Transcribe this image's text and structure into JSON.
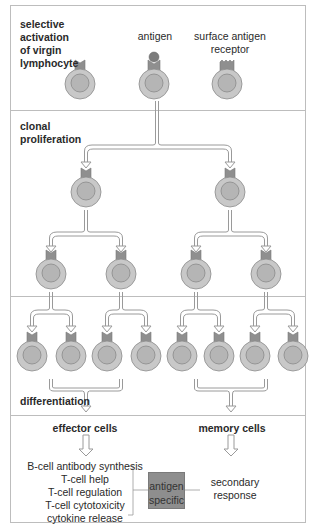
{
  "colors": {
    "cell_outer": "#c8c8c8",
    "cell_inner": "#b5b5b5",
    "cell_stroke": "#8a8a8a",
    "receptor": "#8f8f8f",
    "antigen": "#7c7c7c",
    "frame": "#bdbdbd",
    "arrow_stroke": "#9a9a9a",
    "box_fill": "#8e8e8e"
  },
  "sections": [
    {
      "id": "activation",
      "title": "selective\nactivation\nof virgin\nlymphocyte",
      "lines": [
        "selective",
        "activation",
        "of virgin",
        "lymphocyte"
      ]
    },
    {
      "id": "proliferation",
      "lines": [
        "clonal",
        "proliferation"
      ]
    },
    {
      "id": "differentiation_row",
      "lines": []
    },
    {
      "id": "outcomes",
      "lines": []
    }
  ],
  "labels": {
    "antigen": "antigen",
    "receptor_line1": "surface antigen",
    "receptor_line2": "receptor",
    "differentiation": "differentiation",
    "effector_cells": "effector cells",
    "memory_cells": "memory cells",
    "antigen_specific_line1": "antigen",
    "antigen_specific_line2": "specific",
    "secondary_line1": "secondary",
    "secondary_line2": "response"
  },
  "effector_functions": [
    "B-cell antibody synthesis",
    "T-cell help",
    "T-cell regulation",
    "T-cell cytotoxicity",
    "cytokine release"
  ],
  "cells": {
    "row1": [
      {
        "cx": 80,
        "cy": 84,
        "receptor": "plain"
      },
      {
        "cx": 154,
        "cy": 84,
        "receptor": "bound"
      },
      {
        "cx": 227,
        "cy": 84,
        "receptor": "jagged"
      }
    ],
    "row2": [
      {
        "cx": 86,
        "cy": 192
      },
      {
        "cx": 230,
        "cy": 192
      }
    ],
    "row3": [
      {
        "cx": 51,
        "cy": 274
      },
      {
        "cx": 121,
        "cy": 274
      },
      {
        "cx": 196,
        "cy": 274
      },
      {
        "cx": 266,
        "cy": 274
      }
    ],
    "row4": [
      {
        "cx": 32,
        "cy": 356
      },
      {
        "cx": 71,
        "cy": 356
      },
      {
        "cx": 107,
        "cy": 356
      },
      {
        "cx": 146,
        "cy": 356
      },
      {
        "cx": 182,
        "cy": 356
      },
      {
        "cx": 219,
        "cy": 356
      },
      {
        "cx": 255,
        "cy": 356
      },
      {
        "cx": 293,
        "cy": 356
      }
    ]
  }
}
